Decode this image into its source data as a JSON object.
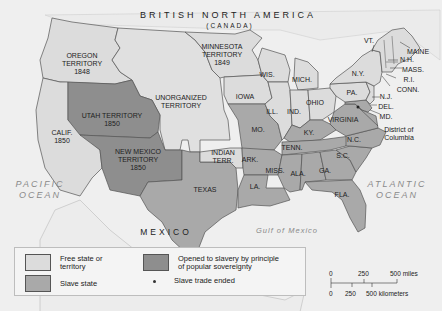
{
  "map": {
    "title": "BRITISH NORTH AMERICA",
    "subtitle": "(CANADA)",
    "colors": {
      "free": "#dcdcdc",
      "slave": "#a9a9a9",
      "popular_sovereignty": "#8e8e8e",
      "unorganized": "#e2e2e2",
      "water": "#efefef",
      "border": "#555555"
    },
    "regions": [
      {
        "id": "oregon",
        "label": "OREGON\nTERRITORY\n1848",
        "status": "free"
      },
      {
        "id": "minnesota",
        "label": "MINNESOTA\nTERRITORY\n1849",
        "status": "free"
      },
      {
        "id": "unorganized",
        "label": "UNORGANIZED\nTERRITORY",
        "status": "free"
      },
      {
        "id": "utah",
        "label": "UTAH TERRITORY\n1850",
        "status": "popular_sovereignty"
      },
      {
        "id": "new-mexico",
        "label": "NEW MEXICO\nTERRITORY\n1850",
        "status": "popular_sovereignty"
      },
      {
        "id": "california",
        "label": "CALIF.\n1850",
        "status": "free"
      },
      {
        "id": "indian-territory",
        "label": "INDIAN\nTERR.",
        "status": "free"
      },
      {
        "id": "texas",
        "label": "TEXAS",
        "status": "slave"
      },
      {
        "id": "iowa",
        "label": "IOWA",
        "status": "free"
      },
      {
        "id": "wisconsin",
        "label": "WIS.",
        "status": "free"
      },
      {
        "id": "michigan",
        "label": "MICH.",
        "status": "free"
      },
      {
        "id": "illinois",
        "label": "ILL.",
        "status": "free"
      },
      {
        "id": "indiana",
        "label": "IND.",
        "status": "free"
      },
      {
        "id": "ohio",
        "label": "OHIO",
        "status": "free"
      },
      {
        "id": "pennsylvania",
        "label": "PA.",
        "status": "free"
      },
      {
        "id": "new-york",
        "label": "N.Y.",
        "status": "free"
      },
      {
        "id": "vermont",
        "label": "VT.",
        "status": "free"
      },
      {
        "id": "maine",
        "label": "MAINE",
        "status": "free"
      },
      {
        "id": "new-hampshire",
        "label": "N.H.",
        "status": "free"
      },
      {
        "id": "massachusetts",
        "label": "MASS.",
        "status": "free"
      },
      {
        "id": "rhode-island",
        "label": "R.I.",
        "status": "free"
      },
      {
        "id": "connecticut",
        "label": "CONN.",
        "status": "free"
      },
      {
        "id": "new-jersey",
        "label": "N.J.",
        "status": "free"
      },
      {
        "id": "delaware",
        "label": "DEL.",
        "status": "slave"
      },
      {
        "id": "maryland",
        "label": "MD.",
        "status": "slave"
      },
      {
        "id": "district-of-columbia",
        "label": "District of\nColumbia",
        "status": "slave_trade_ended"
      },
      {
        "id": "missouri",
        "label": "MO.",
        "status": "slave"
      },
      {
        "id": "kentucky",
        "label": "KY.",
        "status": "slave"
      },
      {
        "id": "virginia",
        "label": "VIRGINIA",
        "status": "slave"
      },
      {
        "id": "north-carolina",
        "label": "N.C.",
        "status": "slave"
      },
      {
        "id": "tennessee",
        "label": "TENN.",
        "status": "slave"
      },
      {
        "id": "south-carolina",
        "label": "S.C.",
        "status": "slave"
      },
      {
        "id": "arkansas",
        "label": "ARK.",
        "status": "slave"
      },
      {
        "id": "mississippi",
        "label": "MISS.",
        "status": "slave"
      },
      {
        "id": "alabama",
        "label": "ALA.",
        "status": "slave"
      },
      {
        "id": "georgia",
        "label": "GA.",
        "status": "slave"
      },
      {
        "id": "louisiana",
        "label": "LA.",
        "status": "slave"
      },
      {
        "id": "florida",
        "label": "FLA.",
        "status": "slave"
      }
    ],
    "water_labels": {
      "pacific": "PACIFIC\nOCEAN",
      "atlantic": "ATLANTIC\nOCEAN",
      "gulf": "Gulf of Mexico"
    },
    "country_labels": {
      "mexico": "MEXICO"
    }
  },
  "legend": {
    "items": [
      {
        "label": "Free state or\nterritory",
        "type": "free"
      },
      {
        "label": "Slave state",
        "type": "slave"
      },
      {
        "label": "Opened to slavery by principle\nof popular sovereignty",
        "type": "popular_sovereignty"
      },
      {
        "label": "Slave trade ended",
        "type": "dot"
      }
    ]
  },
  "scale": {
    "miles": [
      "0",
      "250",
      "500 miles"
    ],
    "kilometers": [
      "0",
      "250",
      "500 kilometers"
    ]
  }
}
